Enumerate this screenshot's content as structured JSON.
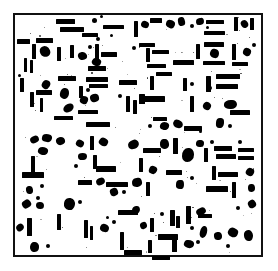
{
  "figure": {
    "title": "",
    "caption": "",
    "width": 278,
    "height": 271,
    "background_color": "#ffffff",
    "foreground_color": "#000000",
    "image_type": "binary-thresholded-particle-field"
  },
  "frame": {
    "name": "plot-border",
    "x": 13,
    "y": 13,
    "width": 250,
    "height": 244,
    "border_width": 2,
    "border_color": "#111111"
  },
  "chart_data": {
    "type": "scatter",
    "title": "",
    "subtitle": "",
    "xlabel": "",
    "ylabel": "",
    "grid": false,
    "legend": null,
    "xlim": [
      13,
      263
    ],
    "ylim": [
      13,
      257
    ],
    "tick_labels_x": [],
    "tick_labels_y": [],
    "annotations": [],
    "shape_classes": [
      "hbar",
      "vbar",
      "blob",
      "dot"
    ],
    "counts": {
      "hbar": 62,
      "vbar": 58,
      "blob": 71,
      "dot": 34,
      "total": 225
    },
    "marks": [
      {
        "c": "hbar",
        "x": 56,
        "y": 19,
        "w": 19,
        "h": 5
      },
      {
        "c": "hbar",
        "x": 60,
        "y": 27,
        "w": 24,
        "h": 5
      },
      {
        "c": "hbar",
        "x": 82,
        "y": 33,
        "w": 16,
        "h": 4
      },
      {
        "c": "dot",
        "x": 92,
        "y": 18,
        "w": 5,
        "h": 5
      },
      {
        "c": "dot",
        "x": 100,
        "y": 15,
        "w": 3,
        "h": 3
      },
      {
        "c": "hbar",
        "x": 103,
        "y": 25,
        "w": 21,
        "h": 4
      },
      {
        "c": "dot",
        "x": 96,
        "y": 37,
        "w": 4,
        "h": 4
      },
      {
        "c": "dot",
        "x": 110,
        "y": 34,
        "w": 3,
        "h": 3
      },
      {
        "c": "vbar",
        "x": 134,
        "y": 21,
        "w": 4,
        "h": 16
      },
      {
        "c": "blob",
        "x": 141,
        "y": 21,
        "w": 8,
        "h": 7
      },
      {
        "c": "hbar",
        "x": 150,
        "y": 18,
        "w": 12,
        "h": 5
      },
      {
        "c": "blob",
        "x": 166,
        "y": 20,
        "w": 9,
        "h": 8
      },
      {
        "c": "blob",
        "x": 178,
        "y": 17,
        "w": 7,
        "h": 9
      },
      {
        "c": "dot",
        "x": 190,
        "y": 24,
        "w": 4,
        "h": 4
      },
      {
        "c": "blob",
        "x": 196,
        "y": 18,
        "w": 8,
        "h": 7
      },
      {
        "c": "hbar",
        "x": 206,
        "y": 20,
        "w": 18,
        "h": 4
      },
      {
        "c": "dot",
        "x": 206,
        "y": 26,
        "w": 3,
        "h": 3
      },
      {
        "c": "hbar",
        "x": 204,
        "y": 31,
        "w": 21,
        "h": 4
      },
      {
        "c": "vbar",
        "x": 234,
        "y": 17,
        "w": 4,
        "h": 14
      },
      {
        "c": "blob",
        "x": 241,
        "y": 20,
        "w": 7,
        "h": 8
      },
      {
        "c": "vbar",
        "x": 250,
        "y": 18,
        "w": 4,
        "h": 12
      },
      {
        "c": "hbar",
        "x": 17,
        "y": 39,
        "w": 13,
        "h": 5
      },
      {
        "c": "vbar",
        "x": 32,
        "y": 44,
        "w": 4,
        "h": 15
      },
      {
        "c": "blob",
        "x": 40,
        "y": 46,
        "w": 10,
        "h": 11
      },
      {
        "c": "hbar",
        "x": 36,
        "y": 38,
        "w": 17,
        "h": 5
      },
      {
        "c": "vbar",
        "x": 24,
        "y": 58,
        "w": 3,
        "h": 14
      },
      {
        "c": "vbar",
        "x": 30,
        "y": 60,
        "w": 3,
        "h": 13
      },
      {
        "c": "vbar",
        "x": 57,
        "y": 47,
        "w": 4,
        "h": 14
      },
      {
        "c": "vbar",
        "x": 70,
        "y": 45,
        "w": 4,
        "h": 13
      },
      {
        "c": "blob",
        "x": 78,
        "y": 52,
        "w": 9,
        "h": 8
      },
      {
        "c": "dot",
        "x": 88,
        "y": 45,
        "w": 4,
        "h": 4
      },
      {
        "c": "vbar",
        "x": 95,
        "y": 44,
        "w": 4,
        "h": 16
      },
      {
        "c": "blob",
        "x": 92,
        "y": 58,
        "w": 9,
        "h": 8
      },
      {
        "c": "hbar",
        "x": 101,
        "y": 52,
        "w": 16,
        "h": 5
      },
      {
        "c": "hbar",
        "x": 88,
        "y": 66,
        "w": 18,
        "h": 5
      },
      {
        "c": "hbar",
        "x": 139,
        "y": 43,
        "w": 16,
        "h": 4
      },
      {
        "c": "vbar",
        "x": 146,
        "y": 48,
        "w": 4,
        "h": 14
      },
      {
        "c": "hbar",
        "x": 152,
        "y": 50,
        "w": 17,
        "h": 4
      },
      {
        "c": "hbar",
        "x": 147,
        "y": 64,
        "w": 19,
        "h": 4
      },
      {
        "c": "dot",
        "x": 132,
        "y": 46,
        "w": 4,
        "h": 4
      },
      {
        "c": "hbar",
        "x": 173,
        "y": 60,
        "w": 21,
        "h": 5
      },
      {
        "c": "vbar",
        "x": 196,
        "y": 44,
        "w": 4,
        "h": 15
      },
      {
        "c": "hbar",
        "x": 204,
        "y": 42,
        "w": 20,
        "h": 5
      },
      {
        "c": "blob",
        "x": 210,
        "y": 49,
        "w": 9,
        "h": 9
      },
      {
        "c": "hbar",
        "x": 203,
        "y": 61,
        "w": 22,
        "h": 4
      },
      {
        "c": "vbar",
        "x": 232,
        "y": 44,
        "w": 4,
        "h": 16
      },
      {
        "c": "hbar",
        "x": 232,
        "y": 62,
        "w": 16,
        "h": 4
      },
      {
        "c": "blob",
        "x": 243,
        "y": 48,
        "w": 8,
        "h": 8
      },
      {
        "c": "dot",
        "x": 252,
        "y": 43,
        "w": 4,
        "h": 4
      },
      {
        "c": "vbar",
        "x": 20,
        "y": 78,
        "w": 4,
        "h": 14
      },
      {
        "c": "dot",
        "x": 18,
        "y": 74,
        "w": 3,
        "h": 3
      },
      {
        "c": "blob",
        "x": 42,
        "y": 80,
        "w": 8,
        "h": 9
      },
      {
        "c": "hbar",
        "x": 58,
        "y": 76,
        "w": 18,
        "h": 5
      },
      {
        "c": "vbar",
        "x": 30,
        "y": 92,
        "w": 4,
        "h": 15
      },
      {
        "c": "hbar",
        "x": 36,
        "y": 90,
        "w": 16,
        "h": 5
      },
      {
        "c": "vbar",
        "x": 40,
        "y": 98,
        "w": 3,
        "h": 14
      },
      {
        "c": "blob",
        "x": 60,
        "y": 88,
        "w": 9,
        "h": 11
      },
      {
        "c": "blob",
        "x": 63,
        "y": 104,
        "w": 11,
        "h": 8
      },
      {
        "c": "hbar",
        "x": 54,
        "y": 116,
        "w": 19,
        "h": 4
      },
      {
        "c": "vbar",
        "x": 79,
        "y": 86,
        "w": 4,
        "h": 12
      },
      {
        "c": "hbar",
        "x": 86,
        "y": 77,
        "w": 22,
        "h": 5
      },
      {
        "c": "hbar",
        "x": 89,
        "y": 84,
        "w": 19,
        "h": 4
      },
      {
        "c": "blob",
        "x": 80,
        "y": 96,
        "w": 8,
        "h": 8
      },
      {
        "c": "blob",
        "x": 90,
        "y": 94,
        "w": 9,
        "h": 8
      },
      {
        "c": "dot",
        "x": 86,
        "y": 88,
        "w": 4,
        "h": 4
      },
      {
        "c": "hbar",
        "x": 78,
        "y": 110,
        "w": 20,
        "h": 4
      },
      {
        "c": "hbar",
        "x": 86,
        "y": 122,
        "w": 24,
        "h": 5
      },
      {
        "c": "hbar",
        "x": 119,
        "y": 80,
        "w": 18,
        "h": 5
      },
      {
        "c": "vbar",
        "x": 126,
        "y": 96,
        "w": 4,
        "h": 16
      },
      {
        "c": "vbar",
        "x": 133,
        "y": 100,
        "w": 4,
        "h": 14
      },
      {
        "c": "dot",
        "x": 118,
        "y": 94,
        "w": 4,
        "h": 4
      },
      {
        "c": "vbar",
        "x": 150,
        "y": 76,
        "w": 4,
        "h": 14
      },
      {
        "c": "hbar",
        "x": 156,
        "y": 72,
        "w": 16,
        "h": 4
      },
      {
        "c": "hbar",
        "x": 140,
        "y": 96,
        "w": 25,
        "h": 6
      },
      {
        "c": "vbar",
        "x": 139,
        "y": 94,
        "w": 6,
        "h": 10
      },
      {
        "c": "vbar",
        "x": 183,
        "y": 78,
        "w": 4,
        "h": 13
      },
      {
        "c": "dot",
        "x": 190,
        "y": 82,
        "w": 4,
        "h": 4
      },
      {
        "c": "vbar",
        "x": 190,
        "y": 96,
        "w": 4,
        "h": 16
      },
      {
        "c": "hbar",
        "x": 153,
        "y": 117,
        "w": 14,
        "h": 4
      },
      {
        "c": "blob",
        "x": 160,
        "y": 122,
        "w": 9,
        "h": 8
      },
      {
        "c": "dot",
        "x": 148,
        "y": 124,
        "w": 4,
        "h": 4
      },
      {
        "c": "blob",
        "x": 173,
        "y": 120,
        "w": 10,
        "h": 8
      },
      {
        "c": "hbar",
        "x": 184,
        "y": 126,
        "w": 18,
        "h": 5
      },
      {
        "c": "vbar",
        "x": 206,
        "y": 76,
        "w": 5,
        "h": 16
      },
      {
        "c": "hbar",
        "x": 216,
        "y": 74,
        "w": 24,
        "h": 5
      },
      {
        "c": "hbar",
        "x": 216,
        "y": 84,
        "w": 22,
        "h": 5
      },
      {
        "c": "dot",
        "x": 208,
        "y": 86,
        "w": 4,
        "h": 4
      },
      {
        "c": "blob",
        "x": 203,
        "y": 102,
        "w": 8,
        "h": 8
      },
      {
        "c": "blob",
        "x": 224,
        "y": 100,
        "w": 13,
        "h": 9
      },
      {
        "c": "hbar",
        "x": 230,
        "y": 110,
        "w": 20,
        "h": 5
      },
      {
        "c": "blob",
        "x": 216,
        "y": 118,
        "w": 8,
        "h": 10
      },
      {
        "c": "dot",
        "x": 228,
        "y": 124,
        "w": 4,
        "h": 4
      },
      {
        "c": "dot",
        "x": 199,
        "y": 130,
        "w": 3,
        "h": 3
      },
      {
        "c": "blob",
        "x": 30,
        "y": 136,
        "w": 9,
        "h": 7
      },
      {
        "c": "blob",
        "x": 42,
        "y": 134,
        "w": 10,
        "h": 8
      },
      {
        "c": "blob",
        "x": 56,
        "y": 137,
        "w": 9,
        "h": 8
      },
      {
        "c": "blob",
        "x": 38,
        "y": 147,
        "w": 10,
        "h": 8
      },
      {
        "c": "vbar",
        "x": 31,
        "y": 156,
        "w": 4,
        "h": 17
      },
      {
        "c": "hbar",
        "x": 22,
        "y": 172,
        "w": 22,
        "h": 6
      },
      {
        "c": "blob",
        "x": 26,
        "y": 186,
        "w": 7,
        "h": 8
      },
      {
        "c": "dot",
        "x": 40,
        "y": 184,
        "w": 4,
        "h": 4
      },
      {
        "c": "dot",
        "x": 36,
        "y": 196,
        "w": 4,
        "h": 4
      },
      {
        "c": "blob",
        "x": 76,
        "y": 140,
        "w": 8,
        "h": 7
      },
      {
        "c": "vbar",
        "x": 90,
        "y": 136,
        "w": 4,
        "h": 14
      },
      {
        "c": "blob",
        "x": 99,
        "y": 138,
        "w": 9,
        "h": 8
      },
      {
        "c": "blob",
        "x": 78,
        "y": 153,
        "w": 9,
        "h": 7
      },
      {
        "c": "vbar",
        "x": 93,
        "y": 155,
        "w": 4,
        "h": 14
      },
      {
        "c": "hbar",
        "x": 96,
        "y": 166,
        "w": 20,
        "h": 6
      },
      {
        "c": "dot",
        "x": 74,
        "y": 164,
        "w": 4,
        "h": 4
      },
      {
        "c": "hbar",
        "x": 78,
        "y": 180,
        "w": 14,
        "h": 5
      },
      {
        "c": "blob",
        "x": 96,
        "y": 178,
        "w": 9,
        "h": 7
      },
      {
        "c": "hbar",
        "x": 106,
        "y": 182,
        "w": 22,
        "h": 5
      },
      {
        "c": "blob",
        "x": 110,
        "y": 188,
        "w": 8,
        "h": 8
      },
      {
        "c": "dot",
        "x": 122,
        "y": 190,
        "w": 4,
        "h": 4
      },
      {
        "c": "blob",
        "x": 128,
        "y": 140,
        "w": 11,
        "h": 9
      },
      {
        "c": "hbar",
        "x": 143,
        "y": 148,
        "w": 18,
        "h": 5
      },
      {
        "c": "vbar",
        "x": 139,
        "y": 158,
        "w": 4,
        "h": 14
      },
      {
        "c": "blob",
        "x": 149,
        "y": 166,
        "w": 8,
        "h": 8
      },
      {
        "c": "blob",
        "x": 132,
        "y": 178,
        "w": 10,
        "h": 9
      },
      {
        "c": "vbar",
        "x": 146,
        "y": 182,
        "w": 4,
        "h": 14
      },
      {
        "c": "blob",
        "x": 160,
        "y": 139,
        "w": 9,
        "h": 10
      },
      {
        "c": "vbar",
        "x": 173,
        "y": 138,
        "w": 5,
        "h": 16
      },
      {
        "c": "blob",
        "x": 182,
        "y": 148,
        "w": 12,
        "h": 14
      },
      {
        "c": "hbar",
        "x": 166,
        "y": 170,
        "w": 16,
        "h": 5
      },
      {
        "c": "blob",
        "x": 176,
        "y": 180,
        "w": 8,
        "h": 9
      },
      {
        "c": "dot",
        "x": 190,
        "y": 176,
        "w": 4,
        "h": 4
      },
      {
        "c": "blob",
        "x": 196,
        "y": 140,
        "w": 8,
        "h": 7
      },
      {
        "c": "dot",
        "x": 210,
        "y": 140,
        "w": 4,
        "h": 4
      },
      {
        "c": "vbar",
        "x": 204,
        "y": 148,
        "w": 4,
        "h": 14
      },
      {
        "c": "hbar",
        "x": 214,
        "y": 146,
        "w": 18,
        "h": 5
      },
      {
        "c": "hbar",
        "x": 216,
        "y": 154,
        "w": 20,
        "h": 5
      },
      {
        "c": "dot",
        "x": 238,
        "y": 140,
        "w": 4,
        "h": 4
      },
      {
        "c": "hbar",
        "x": 238,
        "y": 148,
        "w": 16,
        "h": 4
      },
      {
        "c": "hbar",
        "x": 238,
        "y": 156,
        "w": 16,
        "h": 4
      },
      {
        "c": "vbar",
        "x": 212,
        "y": 166,
        "w": 4,
        "h": 14
      },
      {
        "c": "hbar",
        "x": 218,
        "y": 172,
        "w": 20,
        "h": 5
      },
      {
        "c": "blob",
        "x": 246,
        "y": 168,
        "w": 8,
        "h": 8
      },
      {
        "c": "hbar",
        "x": 206,
        "y": 186,
        "w": 22,
        "h": 6
      },
      {
        "c": "vbar",
        "x": 232,
        "y": 182,
        "w": 4,
        "h": 16
      },
      {
        "c": "blob",
        "x": 248,
        "y": 184,
        "w": 7,
        "h": 8
      },
      {
        "c": "blob",
        "x": 22,
        "y": 200,
        "w": 9,
        "h": 8
      },
      {
        "c": "blob",
        "x": 36,
        "y": 202,
        "w": 8,
        "h": 7
      },
      {
        "c": "vbar",
        "x": 27,
        "y": 218,
        "w": 5,
        "h": 18
      },
      {
        "c": "blob",
        "x": 30,
        "y": 242,
        "w": 9,
        "h": 10
      },
      {
        "c": "vbar",
        "x": 57,
        "y": 214,
        "w": 4,
        "h": 16
      },
      {
        "c": "blob",
        "x": 64,
        "y": 198,
        "w": 11,
        "h": 12
      },
      {
        "c": "dot",
        "x": 78,
        "y": 200,
        "w": 4,
        "h": 4
      },
      {
        "c": "vbar",
        "x": 84,
        "y": 220,
        "w": 4,
        "h": 18
      },
      {
        "c": "vbar",
        "x": 90,
        "y": 226,
        "w": 3,
        "h": 14
      },
      {
        "c": "blob",
        "x": 100,
        "y": 224,
        "w": 9,
        "h": 8
      },
      {
        "c": "dot",
        "x": 112,
        "y": 220,
        "w": 4,
        "h": 4
      },
      {
        "c": "dot",
        "x": 106,
        "y": 216,
        "w": 3,
        "h": 3
      },
      {
        "c": "hbar",
        "x": 118,
        "y": 210,
        "w": 20,
        "h": 5
      },
      {
        "c": "vbar",
        "x": 120,
        "y": 232,
        "w": 4,
        "h": 18
      },
      {
        "c": "blob",
        "x": 132,
        "y": 206,
        "w": 8,
        "h": 8
      },
      {
        "c": "hbar",
        "x": 124,
        "y": 250,
        "w": 18,
        "h": 5
      },
      {
        "c": "vbar",
        "x": 150,
        "y": 218,
        "w": 4,
        "h": 14
      },
      {
        "c": "dot",
        "x": 160,
        "y": 212,
        "w": 4,
        "h": 4
      },
      {
        "c": "vbar",
        "x": 170,
        "y": 210,
        "w": 5,
        "h": 16
      },
      {
        "c": "vbar",
        "x": 176,
        "y": 216,
        "w": 4,
        "h": 12
      },
      {
        "c": "vbar",
        "x": 186,
        "y": 206,
        "w": 5,
        "h": 18
      },
      {
        "c": "blob",
        "x": 196,
        "y": 208,
        "w": 10,
        "h": 7
      },
      {
        "c": "hbar",
        "x": 198,
        "y": 214,
        "w": 14,
        "h": 4
      },
      {
        "c": "dot",
        "x": 190,
        "y": 226,
        "w": 4,
        "h": 4
      },
      {
        "c": "blob",
        "x": 200,
        "y": 226,
        "w": 7,
        "h": 12
      },
      {
        "c": "blob",
        "x": 140,
        "y": 222,
        "w": 7,
        "h": 7
      },
      {
        "c": "hbar",
        "x": 158,
        "y": 234,
        "w": 20,
        "h": 6
      },
      {
        "c": "vbar",
        "x": 172,
        "y": 238,
        "w": 5,
        "h": 14
      },
      {
        "c": "blob",
        "x": 184,
        "y": 240,
        "w": 10,
        "h": 8
      },
      {
        "c": "vbar",
        "x": 148,
        "y": 240,
        "w": 4,
        "h": 13
      },
      {
        "c": "dot",
        "x": 196,
        "y": 240,
        "w": 4,
        "h": 4
      },
      {
        "c": "blob",
        "x": 214,
        "y": 232,
        "w": 8,
        "h": 8
      },
      {
        "c": "blob",
        "x": 228,
        "y": 228,
        "w": 10,
        "h": 9
      },
      {
        "c": "blob",
        "x": 244,
        "y": 230,
        "w": 9,
        "h": 11
      },
      {
        "c": "dot",
        "x": 226,
        "y": 244,
        "w": 4,
        "h": 4
      },
      {
        "c": "hbar",
        "x": 152,
        "y": 256,
        "w": 18,
        "h": 4
      },
      {
        "c": "blob",
        "x": 16,
        "y": 224,
        "w": 8,
        "h": 7
      },
      {
        "c": "dot",
        "x": 46,
        "y": 244,
        "w": 4,
        "h": 4
      },
      {
        "c": "blob",
        "x": 248,
        "y": 200,
        "w": 8,
        "h": 8
      },
      {
        "c": "dot",
        "x": 236,
        "y": 206,
        "w": 4,
        "h": 4
      }
    ]
  }
}
